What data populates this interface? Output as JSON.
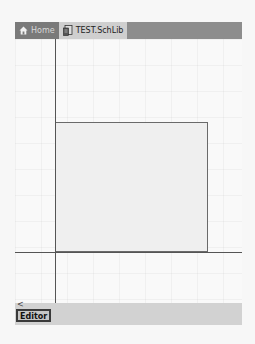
{
  "tabs": [
    {
      "label": "Home",
      "icon": "home-icon",
      "active": false
    },
    {
      "label": "TEST.SchLib",
      "icon": "schlib-document-icon",
      "active": true
    }
  ],
  "statusbar": {
    "scroll_left_glyph": "<",
    "editor_label": "Editor"
  },
  "colors": {
    "tabbar": "#8d8d8d",
    "active_tab": "#cfcfcf",
    "statusbar": "#d2d2d2"
  }
}
